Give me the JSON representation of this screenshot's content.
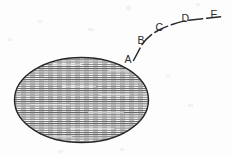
{
  "figure": {
    "background_color": "#fdfdfd",
    "ink_color": "#2b2b2b",
    "width": 232,
    "height": 155,
    "ellipse": {
      "name": "hatched-ellipse",
      "center_x": 81.5,
      "center_y": 100,
      "radius_x": 68,
      "radius_y": 43,
      "outline_color": "#262626",
      "outline_width": 1.4,
      "hatch_style": "horizontal-lines",
      "hatch_color": "#4a4a4a",
      "hatch_spacing": 2.2,
      "hatch_line_width": 0.85
    },
    "curve": {
      "name": "rising-dashed-curve",
      "stroke_color": "#2b2b2b",
      "stroke_width": 1.5,
      "dash_pattern": "14 4",
      "path": "M 133.5 60.5 L 141.5 45.5 Q 147 36.5 158 30.5 Q 172 23.5 186.5 20.5 L 224 16.5",
      "points": [
        {
          "label": "A",
          "x": 133.5,
          "y": 60.5
        },
        {
          "label": "B",
          "x": 144.5,
          "y": 42.0
        },
        {
          "label": "C",
          "x": 161.5,
          "y": 29.5
        },
        {
          "label": "D",
          "x": 187.0,
          "y": 20.5
        },
        {
          "label": "E",
          "x": 224.0,
          "y": 16.5
        }
      ]
    },
    "labels": [
      {
        "name": "point-label-a",
        "text": "A",
        "x": 124.5,
        "y": 62.5
      },
      {
        "name": "point-label-b",
        "text": "B",
        "x": 137.5,
        "y": 43.5
      },
      {
        "name": "point-label-c",
        "text": "C",
        "x": 155.5,
        "y": 31.0
      },
      {
        "name": "point-label-d",
        "text": "D",
        "x": 181.5,
        "y": 22.0
      },
      {
        "name": "point-label-e",
        "text": "E",
        "x": 210.5,
        "y": 18.0
      }
    ]
  }
}
